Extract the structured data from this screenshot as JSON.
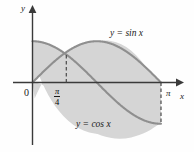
{
  "figure": {
    "background_color": "#fefefe",
    "curve_color": "#8a8a8a",
    "fill_color": "#d6d6d6",
    "axis_color": "#3a3a3a",
    "text_color": "#1a1a1a"
  },
  "labels": {
    "y_axis": "y",
    "x_axis": "x",
    "origin": "0",
    "tick_quarter_pi_numerator": "π",
    "tick_quarter_pi_denominator": "4",
    "tick_pi": "π",
    "curve_sin": "y = sin x",
    "curve_cos": "y = cos x"
  },
  "chart_data": {
    "type": "line",
    "title": "",
    "xlabel": "x",
    "ylabel": "y",
    "xlim": [
      -0.18,
      3.55
    ],
    "ylim": [
      -1.45,
      1.45
    ],
    "grid": false,
    "legend": "inline-curve-labels",
    "xticks": [
      0,
      0.7854,
      3.14159
    ],
    "xticklabels": [
      "0",
      "π/4",
      "π"
    ],
    "yticks": [],
    "yticklabels": [],
    "series": [
      {
        "name": "y = sin x",
        "label": "y = sin x",
        "domain": [
          0,
          3.14159
        ],
        "points_x": [
          0,
          0.19635,
          0.3927,
          0.58905,
          0.7854,
          0.98175,
          1.1781,
          1.37445,
          1.5708,
          1.76715,
          1.9635,
          2.15985,
          2.35619,
          2.55254,
          2.74889,
          2.94524,
          3.14159
        ],
        "points_y": [
          0,
          0.19509,
          0.38268,
          0.55557,
          0.70711,
          0.83147,
          0.92388,
          0.98079,
          1,
          0.98079,
          0.92388,
          0.83147,
          0.70711,
          0.55557,
          0.38268,
          0.19509,
          0
        ]
      },
      {
        "name": "y = cos x",
        "label": "y = cos x",
        "domain": [
          0,
          3.14159
        ],
        "points_x": [
          0,
          0.19635,
          0.3927,
          0.58905,
          0.7854,
          0.98175,
          1.1781,
          1.37445,
          1.5708,
          1.76715,
          1.9635,
          2.15985,
          2.35619,
          2.55254,
          2.74889,
          2.94524,
          3.14159
        ],
        "points_y": [
          1,
          0.98079,
          0.92388,
          0.83147,
          0.70711,
          0.55557,
          0.38268,
          0.19509,
          0,
          -0.19509,
          -0.38268,
          -0.55557,
          -0.70711,
          -0.83147,
          -0.92388,
          -0.98079,
          -1
        ]
      }
    ],
    "shaded_region": {
      "description": "area between y = cos x and y = sin x on [0, pi]",
      "x_from": 0,
      "x_to": 3.14159,
      "upper_before_intersection": "y = cos x",
      "upper_after_intersection": "y = sin x",
      "fill": "#d6d6d6"
    },
    "annotations": [
      {
        "name": "intersection-dashed-line",
        "x": 0.7854,
        "y_from": 0,
        "y_to": 0.70711,
        "style": "dashed"
      },
      {
        "name": "right-boundary-dashed-line",
        "x": 3.14159,
        "y_from": 0,
        "y_to": -1,
        "style": "dashed"
      }
    ]
  }
}
